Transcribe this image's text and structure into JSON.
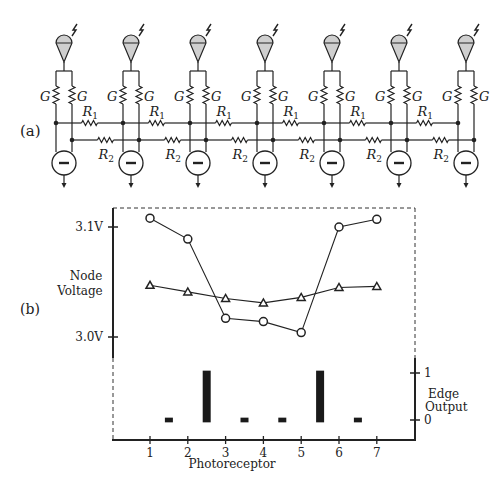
{
  "panel_a": {
    "label": "(a)",
    "cells": 7,
    "conductance_label": "G",
    "r1_label": "R",
    "r1_sub": "1",
    "r2_label": "R",
    "r2_sub": "2",
    "source_symbol": "−"
  },
  "panel_b": {
    "label": "(b)",
    "left_axis_title_line1": "Node",
    "left_axis_title_line2": "Voltage",
    "left_ticks": [
      "3.1V",
      "3.0V"
    ],
    "right_axis_title_line1": "Edge",
    "right_axis_title_line2": "Output",
    "right_ticks": [
      "1",
      "0"
    ],
    "x_axis_title": "Photoreceptor",
    "x_ticks": [
      "1",
      "2",
      "3",
      "4",
      "5",
      "6",
      "7"
    ]
  },
  "chart_data": {
    "type": "line",
    "title": "",
    "xlabel": "Photoreceptor",
    "ylabel": "Node Voltage",
    "y2label": "Edge Output",
    "x": [
      1,
      2,
      3,
      4,
      5,
      6,
      7
    ],
    "ylim": [
      2.97,
      3.12
    ],
    "y2lim": [
      0,
      1
    ],
    "series": [
      {
        "name": "R1 node (circles)",
        "marker": "circle",
        "values": [
          3.108,
          3.089,
          3.017,
          3.014,
          3.004,
          3.1,
          3.107
        ]
      },
      {
        "name": "R2 node (triangles)",
        "marker": "triangle",
        "values": [
          3.047,
          3.041,
          3.035,
          3.031,
          3.036,
          3.045,
          3.046
        ]
      },
      {
        "name": "Edge Output",
        "type": "bar",
        "x": [
          1.5,
          2.5,
          3.5,
          4.5,
          5.5,
          6.5
        ],
        "values": [
          0.05,
          1.05,
          0.05,
          0.05,
          1.05,
          0.05
        ]
      }
    ],
    "grid": false,
    "legend": "none"
  }
}
